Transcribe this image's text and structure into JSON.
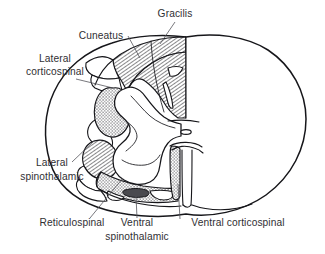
{
  "figure": {
    "background_color": "#ffffff",
    "ink_color": "#16161a",
    "label_color": "#2f2f33",
    "leader_color": "#55555c",
    "dark_patch_color": "#4a4a4f"
  },
  "labels": [
    {
      "id": "gracilis",
      "text": "Gracilis",
      "x": 175,
      "y": 17,
      "anchor": "middle",
      "leader": "M 175,22 L 160,44"
    },
    {
      "id": "cuneatus",
      "text": "Cuneatus",
      "x": 101,
      "y": 39,
      "anchor": "middle",
      "leader": "M 128,36 L 140,58"
    },
    {
      "id": "lateral-corticospinal",
      "text_line1": "Lateral",
      "text_line2": "corticospinal",
      "x": 55,
      "y": 62,
      "y2": 75,
      "anchor": "middle",
      "leader": "M 76,79 L 113,88"
    },
    {
      "id": "lateral-spinothalamic",
      "text_line1": "Lateral",
      "text_line2": "spinothalamic",
      "x": 52,
      "y": 166,
      "y2": 180,
      "anchor": "middle",
      "leader": "M 72,162 L 95,140"
    },
    {
      "id": "reticulospinal",
      "text": "Reticulospinal",
      "x": 72,
      "y": 226,
      "anchor": "middle",
      "leader": "M 90,218 L 123,178"
    },
    {
      "id": "ventral-spinothalamic",
      "text_line1": "Ventral",
      "text_line2": "spinothalamic",
      "x": 137,
      "y": 226,
      "y2": 240,
      "anchor": "middle",
      "leader": "M 137,218 L 136,196"
    },
    {
      "id": "ventral-corticospinal",
      "text": "Ventral corticospinal",
      "x": 238,
      "y": 226,
      "anchor": "middle",
      "leader": "M 180,219 L 178,184"
    }
  ],
  "regions": [
    {
      "id": "fasciculus-gracilis",
      "pattern": "hatch"
    },
    {
      "id": "fasciculus-cuneatus",
      "pattern": "hatch"
    },
    {
      "id": "lateral-corticospinal-tract",
      "pattern": "stipple"
    },
    {
      "id": "lateral-spinothalamic-tract",
      "pattern": "hatch"
    },
    {
      "id": "reticulospinal-tract",
      "pattern": "stipple"
    },
    {
      "id": "ventral-spinothalamic-tract",
      "pattern": "solid-dark"
    },
    {
      "id": "ventral-corticospinal-tract",
      "pattern": "stipple"
    },
    {
      "id": "gray-matter",
      "pattern": "none"
    },
    {
      "id": "right-hemisection",
      "pattern": "none"
    }
  ]
}
